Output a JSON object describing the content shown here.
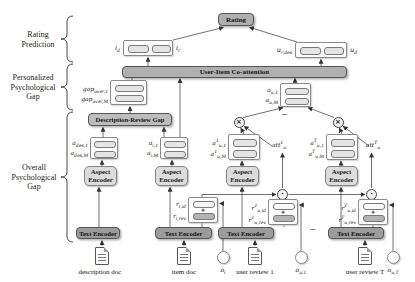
{
  "sections": {
    "rating_prediction": "Rating Prediction",
    "personalized_gap": "Personalized Psychological Gap",
    "overall_gap": "Overall Psychological Gap"
  },
  "top": {
    "rating": "Rating",
    "item_coatt": {
      "left": "i_{d}",
      "right": "i_{r}"
    },
    "user_coatt": {
      "left": "u_{r,des}",
      "right": "u_{d}"
    },
    "coattention": "User-Item Co-attention"
  },
  "personalized": {
    "gap_first": "gap_{over,1}",
    "gap_last": "gap_{over,M}",
    "drg": "Description-Review Gap"
  },
  "aspects": {
    "des": {
      "first": "a_{des,1}",
      "last": "a_{des,M}"
    },
    "item": {
      "first": "a_{i,1}",
      "last": "a_{i,M}"
    },
    "user": {
      "first": "a_{u,1}",
      "last": "a_{u,M}"
    },
    "rev1": {
      "first": "a^{1}_{u,1}",
      "last": "a^{1}_{u,M}"
    },
    "revT": {
      "first": "a^{T}_{u,1}",
      "last": "a^{T}_{u,M}"
    },
    "att1": "att^{1}_{u}",
    "attT": "att^{T}_{u}"
  },
  "encoders": {
    "aspect": "Aspect Encoder",
    "text": "Text Encoder"
  },
  "reps": {
    "item": {
      "id": "r_{i,id}",
      "rev": "r_{i,rev}"
    },
    "rev1": {
      "id": "r^{1}_{u,id}",
      "rev": "r^{1}_{u,rev}"
    },
    "revT": {
      "id": "r^{T}_{u,id}",
      "rev": "r^{T}_{u,rev}"
    },
    "plus": "+"
  },
  "ids": {
    "item": "o_{i}",
    "rev1": "o_{u,1}",
    "revT": "o_{u,T}"
  },
  "docs": {
    "description": "description doc",
    "item": "item doc",
    "review1": "user review 1",
    "reviewT": "user review T"
  },
  "ops": {
    "multiply": "×",
    "dot": "·"
  },
  "ellipsis": "–",
  "colors": {
    "box_gray": "#afafaf",
    "text_encoder_gray": "#9c9c9c",
    "encoder_light": "#dcdcdc",
    "cell_light": "#e4e4e4",
    "cell_dark": "#b3b3b3",
    "line": "#333333"
  }
}
